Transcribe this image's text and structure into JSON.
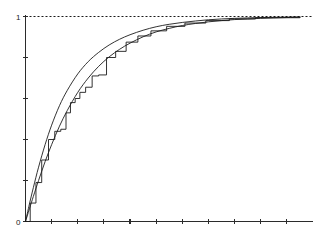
{
  "chart_data": {
    "type": "line",
    "title": "",
    "subtitle": "",
    "xlabel": "",
    "ylabel": "",
    "xlim": [
      0,
      11
    ],
    "ylim": [
      0,
      1.08
    ],
    "grid": false,
    "legend": null,
    "y_tick_labels": [
      "0",
      "",
      "",
      "",
      "",
      "1"
    ],
    "y_ticks": [
      0,
      0.2,
      0.4,
      0.6,
      0.8,
      1
    ],
    "x_ticks": [
      0,
      1,
      2,
      3,
      4,
      5,
      6,
      7,
      8,
      9,
      10
    ],
    "x_tick_labels": [
      "",
      "",
      "",
      "",
      "",
      "",
      "",
      "",
      "",
      "",
      ""
    ],
    "annotations": [
      {
        "name": "y-max-label",
        "text": "1",
        "x": 0,
        "y": 1
      },
      {
        "name": "origin-label",
        "text": "0",
        "x": 0,
        "y": 0
      }
    ],
    "reference_lines": [
      {
        "name": "asymptote",
        "orientation": "horizontal",
        "value": 1,
        "style": "dashed"
      }
    ],
    "series": [
      {
        "name": "theoretical-cdf-a",
        "style": "solid",
        "x": [
          0,
          0.15,
          0.3,
          0.5,
          0.75,
          1,
          1.3,
          1.6,
          2,
          2.4,
          2.8,
          3.2,
          3.6,
          4,
          4.5,
          5,
          5.5,
          6,
          6.5,
          7,
          7.5,
          8,
          8.5,
          9,
          9.5,
          10,
          10.5
        ],
        "y": [
          0,
          0.085,
          0.165,
          0.265,
          0.375,
          0.47,
          0.565,
          0.64,
          0.72,
          0.78,
          0.825,
          0.861,
          0.889,
          0.911,
          0.933,
          0.95,
          0.962,
          0.971,
          0.978,
          0.984,
          0.988,
          0.991,
          0.993,
          0.995,
          0.996,
          0.997,
          0.998
        ]
      },
      {
        "name": "theoretical-cdf-b",
        "style": "solid",
        "x": [
          0,
          0.15,
          0.3,
          0.5,
          0.75,
          1,
          1.3,
          1.6,
          2,
          2.4,
          2.8,
          3.2,
          3.6,
          4,
          4.5,
          5,
          5.5,
          6,
          6.5,
          7,
          7.5,
          8,
          8.5,
          9,
          9.5,
          10,
          10.5
        ],
        "y": [
          0,
          0.062,
          0.122,
          0.2,
          0.292,
          0.375,
          0.465,
          0.542,
          0.63,
          0.7,
          0.757,
          0.803,
          0.84,
          0.87,
          0.901,
          0.925,
          0.942,
          0.956,
          0.966,
          0.974,
          0.98,
          0.985,
          0.988,
          0.991,
          0.993,
          0.995,
          0.996
        ]
      },
      {
        "name": "empirical-step-cdf",
        "style": "step",
        "x": [
          0,
          0.18,
          0.4,
          0.62,
          0.88,
          1.12,
          1.35,
          1.55,
          1.72,
          1.9,
          2.08,
          2.3,
          2.55,
          2.8,
          3.1,
          3.45,
          3.85,
          4.3,
          4.8,
          5.4,
          6.1,
          6.9,
          7.8,
          8.8,
          10.5
        ],
        "y": [
          0,
          0.09,
          0.19,
          0.3,
          0.4,
          0.44,
          0.45,
          0.53,
          0.58,
          0.6,
          0.63,
          0.655,
          0.71,
          0.715,
          0.8,
          0.83,
          0.875,
          0.905,
          0.93,
          0.952,
          0.968,
          0.98,
          0.988,
          0.994,
          0.999
        ]
      }
    ]
  },
  "figure": {
    "background_color": "#ffffff",
    "axis_color": "#2b2b2b",
    "curve_color": "#1c1c1c"
  }
}
